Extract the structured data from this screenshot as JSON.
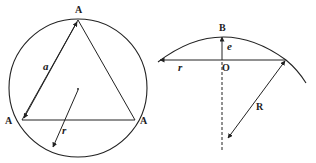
{
  "left_figure": {
    "circle": {
      "cx": 78,
      "cy": 88,
      "r": 69
    },
    "triangle": {
      "vertices": [
        [
          78,
          19
        ],
        [
          21,
          120
        ],
        [
          136,
          120
        ]
      ]
    },
    "vertex_labels": [
      "A",
      "A",
      "A"
    ],
    "side_label": "a",
    "radius_label": "r"
  },
  "right_figure": {
    "top_label": "B",
    "sagitta_label": "e",
    "center_label": "O",
    "half_chord_label": "r",
    "radius_label": "R"
  },
  "colors": {
    "stroke": "#222222",
    "background": "#ffffff"
  }
}
